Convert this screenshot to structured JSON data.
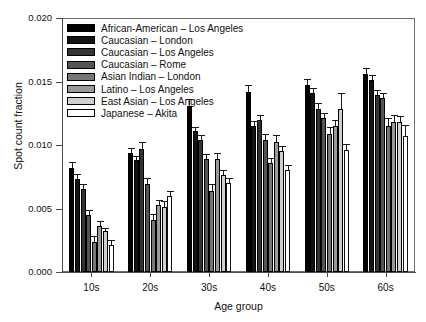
{
  "chart_data": {
    "type": "bar",
    "title": "",
    "xlabel": "Age group",
    "ylabel": "Spot count fraction",
    "categories": [
      "10s",
      "20s",
      "30s",
      "40s",
      "50s",
      "60s"
    ],
    "ylim": [
      0.0,
      0.02
    ],
    "yticks": [
      "0.000",
      "0.005",
      "0.010",
      "0.015",
      "0.020"
    ],
    "ytick_values": [
      0.0,
      0.005,
      0.01,
      0.015,
      0.02
    ],
    "grid": false,
    "legend_position": "upper-left",
    "errorbars": true,
    "series": [
      {
        "name": "African-American – Los Angeles",
        "color": "#000000",
        "values": [
          0.0082,
          0.0094,
          0.0131,
          0.0142,
          0.0147,
          0.0156
        ],
        "errors": [
          0.0005,
          0.0004,
          0.0005,
          0.0005,
          0.0005,
          0.0005
        ]
      },
      {
        "name": "Caucasian – London",
        "color": "#131313",
        "values": [
          0.0073,
          0.0088,
          0.0111,
          0.0115,
          0.0141,
          0.0151
        ],
        "errors": [
          0.0004,
          0.0003,
          0.0003,
          0.0004,
          0.0004,
          0.0004
        ]
      },
      {
        "name": "Caucasian – Los Angeles",
        "color": "#333333",
        "values": [
          0.0065,
          0.0097,
          0.0104,
          0.012,
          0.0128,
          0.0139
        ],
        "errors": [
          0.0004,
          0.0005,
          0.0004,
          0.0004,
          0.0005,
          0.0004
        ]
      },
      {
        "name": "Caucasian – Rome",
        "color": "#555555",
        "values": [
          0.0045,
          0.0069,
          0.0089,
          0.0104,
          0.0121,
          0.0137
        ],
        "errors": [
          0.0004,
          0.0005,
          0.0004,
          0.0005,
          0.0004,
          0.0004
        ]
      },
      {
        "name": "Asian Indian – London",
        "color": "#777777",
        "values": [
          0.0024,
          0.0041,
          0.0064,
          0.0086,
          0.0109,
          0.0115
        ],
        "errors": [
          0.0004,
          0.0005,
          0.0005,
          0.0004,
          0.0005,
          0.0006
        ]
      },
      {
        "name": "Latino – Los Angeles",
        "color": "#9a9a9a",
        "values": [
          0.0036,
          0.0053,
          0.0089,
          0.0102,
          0.0115,
          0.0118
        ],
        "errors": [
          0.0004,
          0.0004,
          0.0005,
          0.0006,
          0.0005,
          0.0006
        ]
      },
      {
        "name": "East Asian – Los Angeles",
        "color": "#cfcfcf",
        "values": [
          0.0032,
          0.0051,
          0.0076,
          0.0095,
          0.0128,
          0.0118
        ],
        "errors": [
          0.0003,
          0.0005,
          0.0004,
          0.0004,
          0.0013,
          0.0005
        ]
      },
      {
        "name": "Japanese – Akita",
        "color": "#ffffff",
        "values": [
          0.0021,
          0.006,
          0.007,
          0.008,
          0.0096,
          0.0107
        ],
        "errors": [
          0.0004,
          0.0004,
          0.0004,
          0.0004,
          0.0005,
          0.0009
        ]
      }
    ]
  }
}
